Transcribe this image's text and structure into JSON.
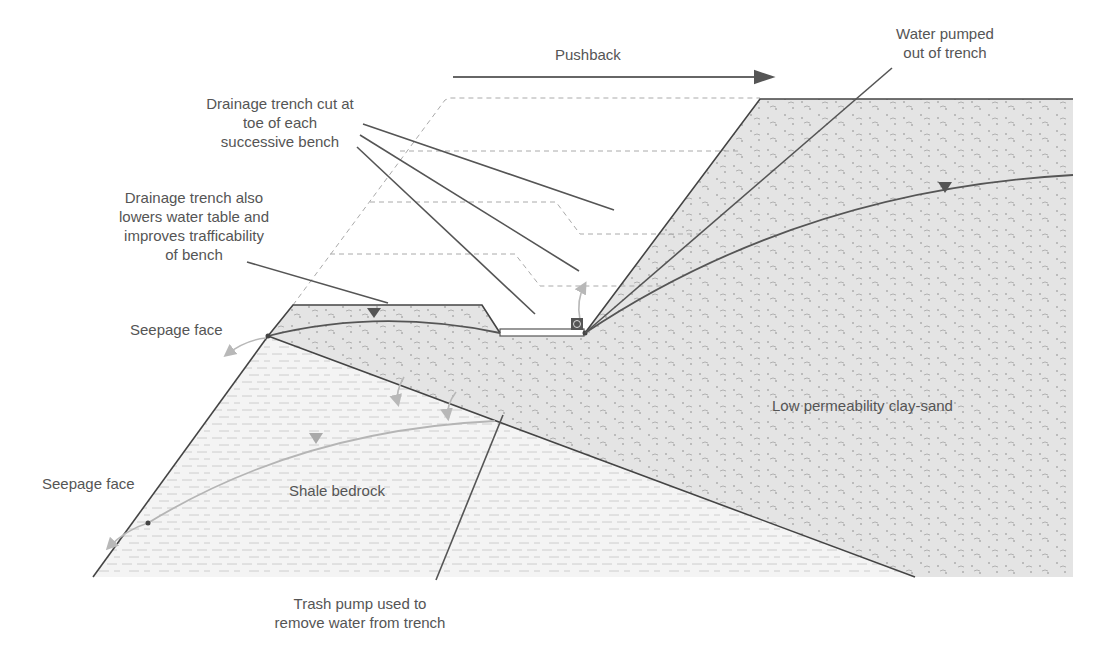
{
  "diagram": {
    "direction_label": "Pushback",
    "labels": {
      "drainage_trench_cut": [
        "Drainage trench cut at",
        "toe of each",
        "successive bench"
      ],
      "drainage_trench_also": [
        "Drainage trench also",
        "lowers water table and",
        "improves trafficability",
        "of bench"
      ],
      "water_pumped": [
        "Water pumped",
        "out of trench"
      ],
      "seepage_face_upper": "Seepage face",
      "seepage_face_lower": "Seepage face",
      "shale_bedrock": "Shale bedrock",
      "clay_sand": "Low permeability clay-sand",
      "trash_pump": [
        "Trash pump used to",
        "remove water from trench"
      ]
    },
    "materials": [
      {
        "name": "Low permeability clay-sand",
        "pattern": "dotted-dash",
        "fill": "#e4e4e4"
      },
      {
        "name": "Shale bedrock",
        "pattern": "dashed-lines",
        "fill": "#f4f4f4"
      }
    ],
    "symbols": [
      "water-table-triangle",
      "trash-pump",
      "flow-arrow",
      "pushback-arrow"
    ],
    "colors": {
      "line": "#444444",
      "dashed_outline": "#aaaaaa",
      "flow_arrow": "#b8b8b8",
      "clay_fill": "#e4e4e4",
      "shale_fill": "#f4f4f4",
      "text": "#555555"
    }
  }
}
